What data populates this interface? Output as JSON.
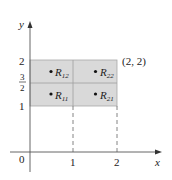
{
  "axes": {
    "x_label": "x",
    "y_label": "y",
    "origin_label": "0",
    "x_ticks": [
      "1",
      "2"
    ],
    "y_ticks": {
      "one": "1",
      "two": "2",
      "three_halves_num": "3",
      "three_halves_den": "2"
    }
  },
  "corner_label": "(2, 2)",
  "regions": [
    {
      "name": "R",
      "sub": "12"
    },
    {
      "name": "R",
      "sub": "22"
    },
    {
      "name": "R",
      "sub": "11"
    },
    {
      "name": "R",
      "sub": "21"
    }
  ],
  "colors": {
    "fill": "#d9d9d9",
    "stroke": "#9a9a9a",
    "axis": "#555555"
  }
}
